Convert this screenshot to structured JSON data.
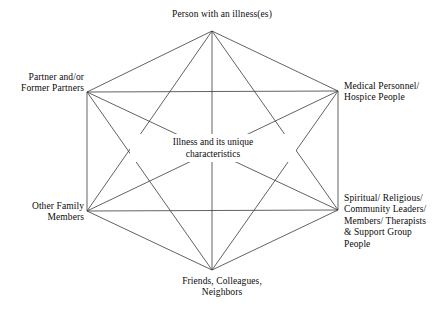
{
  "diagram": {
    "type": "complete-graph-hexagon",
    "line_color": "#3a3a3a",
    "text_color": "#0a0a0a",
    "background_color": "#ffffff",
    "center": {
      "name": "illness-core",
      "lines": [
        "Illness and its unique",
        "characteristics"
      ]
    },
    "nodes": [
      {
        "id": "person-with-illness",
        "position": "top",
        "x": 212,
        "y": 31,
        "lines": [
          "Person with an illness(es)"
        ]
      },
      {
        "id": "partner-former-partners",
        "position": "left-upper",
        "x": 87,
        "y": 92,
        "lines": [
          "Partner and/or",
          "Former Partners"
        ]
      },
      {
        "id": "medical-personnel-hospice",
        "position": "right-upper",
        "x": 338,
        "y": 91,
        "lines": [
          "Medical Personnel/",
          "Hospice People"
        ]
      },
      {
        "id": "other-family-members",
        "position": "left-lower",
        "x": 87,
        "y": 211,
        "lines": [
          "Other Family",
          "Members"
        ]
      },
      {
        "id": "spiritual-religious-support",
        "position": "right-lower",
        "x": 338,
        "y": 210,
        "lines": [
          "Spiritual/ Religious/",
          "Community Leaders/",
          "Members/ Therapists",
          "& Support Group",
          "People"
        ]
      },
      {
        "id": "friends-colleagues-neighbors",
        "position": "bottom",
        "x": 212,
        "y": 270,
        "lines": [
          "Friends, Colleagues,",
          "Neighbors"
        ]
      }
    ],
    "edges": [
      [
        "person-with-illness",
        "partner-former-partners"
      ],
      [
        "person-with-illness",
        "medical-personnel-hospice"
      ],
      [
        "person-with-illness",
        "other-family-members"
      ],
      [
        "person-with-illness",
        "spiritual-religious-support"
      ],
      [
        "person-with-illness",
        "friends-colleagues-neighbors"
      ],
      [
        "partner-former-partners",
        "medical-personnel-hospice"
      ],
      [
        "partner-former-partners",
        "other-family-members"
      ],
      [
        "partner-former-partners",
        "spiritual-religious-support"
      ],
      [
        "partner-former-partners",
        "friends-colleagues-neighbors"
      ],
      [
        "medical-personnel-hospice",
        "other-family-members"
      ],
      [
        "medical-personnel-hospice",
        "spiritual-religious-support"
      ],
      [
        "medical-personnel-hospice",
        "friends-colleagues-neighbors"
      ],
      [
        "other-family-members",
        "spiritual-religious-support"
      ],
      [
        "other-family-members",
        "friends-colleagues-neighbors"
      ],
      [
        "spiritual-religious-support",
        "friends-colleagues-neighbors"
      ]
    ]
  }
}
